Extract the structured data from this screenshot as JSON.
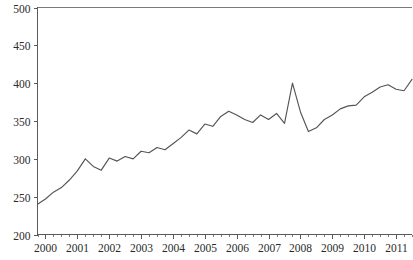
{
  "chart_data": {
    "type": "line",
    "title": "",
    "subtitle": "",
    "xlabel": "",
    "ylabel": "",
    "grid": false,
    "legend": "none",
    "legend_entries": [],
    "annotations": [],
    "line_color": "#555555",
    "axis_color": "#5a5a5a",
    "background_color": "#ffffff",
    "xlim": [
      1999.75,
      2011.5
    ],
    "ylim": [
      200,
      500
    ],
    "y_ticks": [
      200,
      250,
      300,
      350,
      400,
      450,
      500
    ],
    "y_tick_labels": [
      "200",
      "250",
      "300",
      "350",
      "400",
      "450",
      "500"
    ],
    "x_ticks": [
      2000,
      2001,
      2002,
      2003,
      2004,
      2005,
      2006,
      2007,
      2008,
      2009,
      2010,
      2011
    ],
    "x_tick_labels": [
      "2000",
      "2001",
      "2002",
      "2003",
      "2004",
      "2005",
      "2006",
      "2007",
      "2008",
      "2009",
      "2010",
      "2011"
    ],
    "x_minor_ticks_per_year": 4,
    "x_values": [
      1999.75,
      2000.0,
      2000.25,
      2000.5,
      2000.75,
      2001.0,
      2001.25,
      2001.5,
      2001.75,
      2002.0,
      2002.25,
      2002.5,
      2002.75,
      2003.0,
      2003.25,
      2003.5,
      2003.75,
      2004.0,
      2004.25,
      2004.5,
      2004.75,
      2005.0,
      2005.25,
      2005.5,
      2005.75,
      2006.0,
      2006.25,
      2006.5,
      2006.75,
      2007.0,
      2007.25,
      2007.5,
      2007.75,
      2008.0,
      2008.25,
      2008.5,
      2008.75,
      2009.0,
      2009.25,
      2009.5,
      2009.75,
      2010.0,
      2010.25,
      2010.5,
      2010.75,
      2011.0,
      2011.25,
      2011.5
    ],
    "values": [
      240,
      247,
      256,
      262,
      272,
      284,
      300,
      290,
      285,
      301,
      297,
      303,
      300,
      310,
      308,
      315,
      312,
      320,
      328,
      338,
      333,
      346,
      343,
      356,
      363,
      358,
      352,
      348,
      358,
      352,
      360,
      347,
      400,
      362,
      336,
      341,
      352,
      358,
      366,
      370,
      371,
      382,
      388,
      395,
      398,
      392,
      390,
      405
    ],
    "series_name": "",
    "y_max_value": 497,
    "y_min_value": 240,
    "last_value": 467
  },
  "chart_tail": {
    "x_values": [
      2011.5,
      2011.75,
      2012.0,
      2012.25,
      2012.5,
      2012.75,
      2013.0
    ],
    "values": [
      405,
      412,
      420,
      428,
      424,
      430,
      432
    ]
  }
}
